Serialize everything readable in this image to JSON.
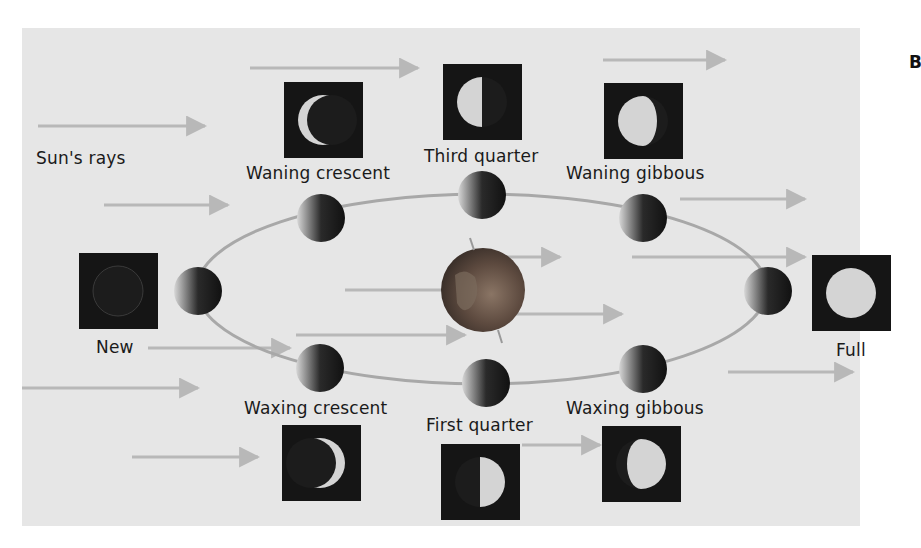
{
  "figure": {
    "panel_letter": "B",
    "sun_label": "Sun's rays",
    "center_body": "Earth",
    "colors": {
      "background": "#e6e6e6",
      "box": "#151515",
      "lit": "#d4d4d4",
      "orbit": "#a8a8a8",
      "ray": "#b8b8b8",
      "earth": "#6b5648"
    }
  },
  "phases": [
    {
      "id": "new",
      "label": "New"
    },
    {
      "id": "waxing-crescent",
      "label": "Waxing crescent"
    },
    {
      "id": "first-quarter",
      "label": "First quarter"
    },
    {
      "id": "waxing-gibbous",
      "label": "Waxing gibbous"
    },
    {
      "id": "full",
      "label": "Full"
    },
    {
      "id": "waning-gibbous",
      "label": "Waning gibbous"
    },
    {
      "id": "third-quarter",
      "label": "Third quarter"
    },
    {
      "id": "waning-crescent",
      "label": "Waning crescent"
    }
  ]
}
